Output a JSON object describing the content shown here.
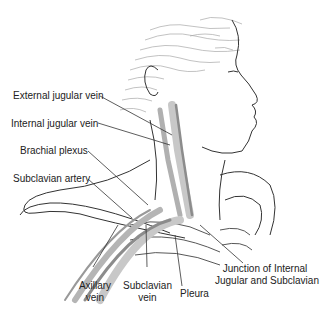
{
  "diagram": {
    "labels": {
      "external_jugular_vein": "External jugular vein",
      "internal_jugular_vein": "Internal jugular vein",
      "brachial_plexus": "Brachial plexus",
      "subclavian_artery": "Subclavian artery",
      "axillary_vein_1": "Axillary",
      "axillary_vein_2": "vein",
      "subclavian_vein_1": "Subclavian",
      "subclavian_vein_2": "vein",
      "pleura": "Pleura",
      "junction_1": "Junction of Internal",
      "junction_2": "Jugular and Subclavian"
    },
    "colors": {
      "line": "#333333",
      "hair": "#9a9a9a",
      "vessel": "#8c8c8c",
      "vessel_light": "#c8c8c8"
    }
  }
}
